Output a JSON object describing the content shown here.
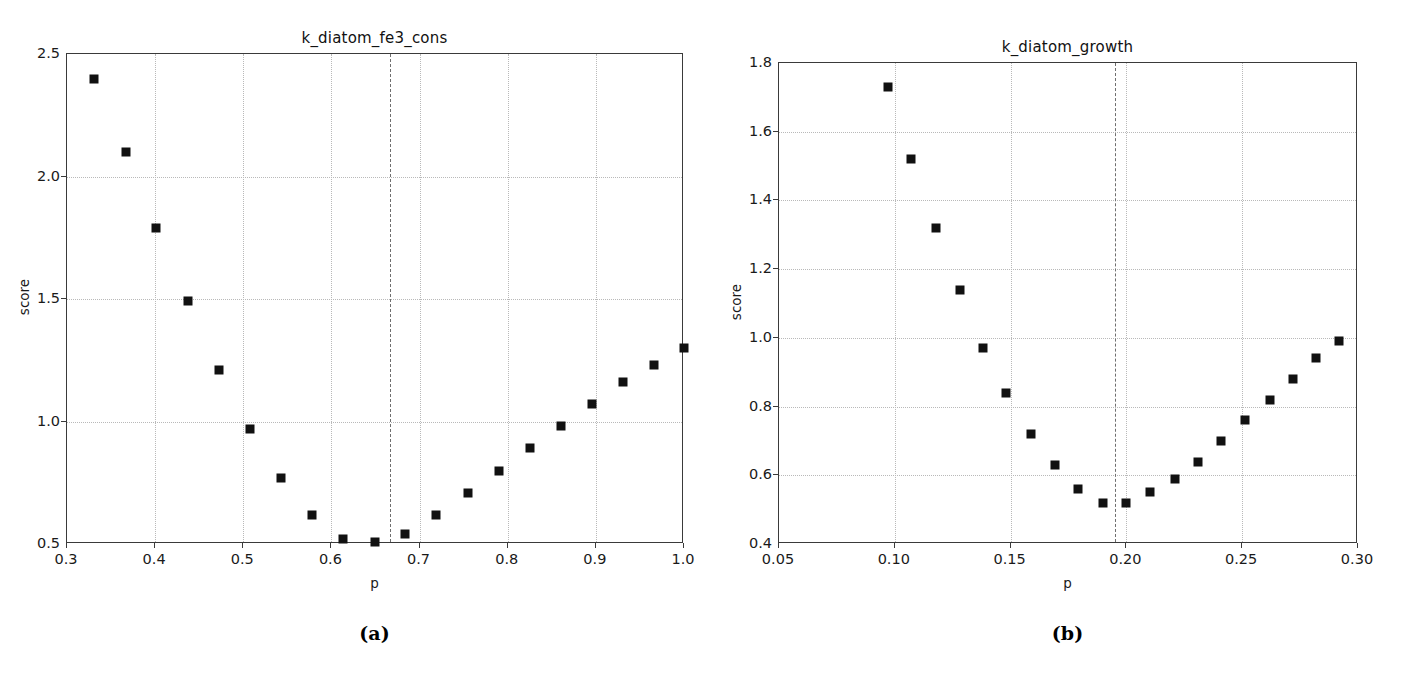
{
  "figure": {
    "background": "#ffffff",
    "marker_color": "#111111",
    "grid_color": "#b9b9b9",
    "axis_color": "#3a3a3a",
    "vline_color": "#6e6e6e"
  },
  "panels": [
    {
      "caption": "(a)",
      "chart_data": {
        "type": "scatter",
        "title": "k_diatom_fe3_cons",
        "xlabel": "p",
        "ylabel": "score",
        "xlim": [
          0.3,
          1.0
        ],
        "ylim": [
          0.5,
          2.5
        ],
        "xticks": [
          0.3,
          0.4,
          0.5,
          0.6,
          0.7,
          0.8,
          0.9,
          1.0
        ],
        "xticklabels": [
          "0.3",
          "0.4",
          "0.5",
          "0.6",
          "0.7",
          "0.8",
          "0.9",
          "1.0"
        ],
        "yticks": [
          0.5,
          1.0,
          1.5,
          2.0,
          2.5
        ],
        "yticklabels": [
          "0.5",
          "1.0",
          "1.5",
          "2.0",
          "2.5"
        ],
        "grid": true,
        "legend": null,
        "vline": 0.667,
        "vline_style": "dashed",
        "x": [
          0.331,
          0.367,
          0.401,
          0.437,
          0.472,
          0.508,
          0.543,
          0.578,
          0.613,
          0.649,
          0.684,
          0.719,
          0.755,
          0.79,
          0.825,
          0.86,
          0.896,
          0.931,
          0.966,
          1.0
        ],
        "y": [
          2.4,
          2.1,
          1.79,
          1.49,
          1.21,
          0.97,
          0.77,
          0.62,
          0.52,
          0.51,
          0.54,
          0.62,
          0.71,
          0.8,
          0.89,
          0.98,
          1.07,
          1.16,
          1.23,
          1.3
        ]
      }
    },
    {
      "caption": "(b)",
      "chart_data": {
        "type": "scatter",
        "title": "k_diatom_growth",
        "xlabel": "p",
        "ylabel": "score",
        "xlim": [
          0.05,
          0.3
        ],
        "ylim": [
          0.4,
          1.8
        ],
        "xticks": [
          0.05,
          0.1,
          0.15,
          0.2,
          0.25,
          0.3
        ],
        "xticklabels": [
          "0.05",
          "0.10",
          "0.15",
          "0.20",
          "0.25",
          "0.30"
        ],
        "yticks": [
          0.4,
          0.6,
          0.8,
          1.0,
          1.2,
          1.4,
          1.6,
          1.8
        ],
        "yticklabels": [
          "0.4",
          "0.6",
          "0.8",
          "1.0",
          "1.2",
          "1.4",
          "1.6",
          "1.8"
        ],
        "grid": true,
        "legend": null,
        "vline": 0.195,
        "vline_style": "dashed",
        "x": [
          0.097,
          0.107,
          0.118,
          0.128,
          0.138,
          0.148,
          0.159,
          0.169,
          0.179,
          0.19,
          0.2,
          0.21,
          0.221,
          0.231,
          0.241,
          0.251,
          0.262,
          0.272,
          0.282,
          0.292
        ],
        "y": [
          1.73,
          1.52,
          1.32,
          1.14,
          0.97,
          0.84,
          0.72,
          0.63,
          0.56,
          0.52,
          0.52,
          0.55,
          0.59,
          0.64,
          0.7,
          0.76,
          0.82,
          0.88,
          0.94,
          0.99
        ]
      }
    }
  ]
}
